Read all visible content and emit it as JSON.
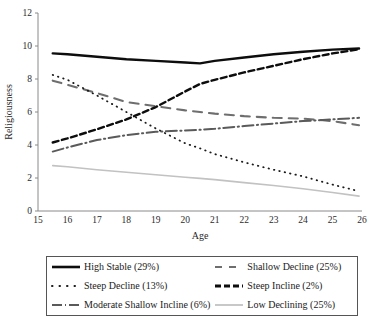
{
  "chart_data": {
    "type": "line",
    "title": "",
    "xlabel": "Age",
    "ylabel": "Religiousness",
    "xlim": [
      15,
      26
    ],
    "ylim": [
      0,
      12
    ],
    "xticks": [
      15,
      16,
      17,
      18,
      19,
      20,
      21,
      22,
      23,
      24,
      25,
      26
    ],
    "yticks": [
      0,
      2,
      4,
      6,
      8,
      10,
      12
    ],
    "grid": false,
    "legend_position": "bottom",
    "x": [
      15.5,
      16,
      17,
      18,
      19,
      20,
      20.5,
      21,
      22,
      23,
      24,
      25,
      25.9
    ],
    "series": [
      {
        "name": "High Stable (29%)",
        "label": "High Stable (29%)",
        "style": "solid-thick",
        "color": "#0d0d0d",
        "width": 2.4,
        "values": [
          9.55,
          9.5,
          9.35,
          9.2,
          9.1,
          9.0,
          8.95,
          9.1,
          9.3,
          9.5,
          9.65,
          9.78,
          9.85
        ]
      },
      {
        "name": "Shallow Decline (25%)",
        "label": "Shallow Decline (25%)",
        "style": "long-dash",
        "color": "#6e6e6e",
        "width": 2.1,
        "values": [
          7.9,
          7.65,
          7.15,
          6.6,
          6.35,
          6.1,
          6.0,
          5.9,
          5.75,
          5.65,
          5.6,
          5.45,
          5.2
        ]
      },
      {
        "name": "Steep Decline (13%)",
        "label": "Steep Decline (13%)",
        "style": "dotted",
        "color": "#1a1a1a",
        "width": 1.8,
        "values": [
          8.25,
          7.95,
          7.0,
          6.0,
          5.0,
          4.1,
          3.8,
          3.45,
          2.95,
          2.5,
          2.1,
          1.6,
          1.2
        ]
      },
      {
        "name": "Steep Incline (2%)",
        "label": "Steep Incline (2%)",
        "style": "heavy-dash",
        "color": "#0d0d0d",
        "width": 2.4,
        "values": [
          4.15,
          4.4,
          4.95,
          5.55,
          6.3,
          7.25,
          7.7,
          7.95,
          8.4,
          8.8,
          9.2,
          9.55,
          9.8
        ]
      },
      {
        "name": "Moderate Shallow Incline (6%)",
        "label": "Moderate Shallow Incline (6%)",
        "style": "dash-dot",
        "color": "#5a5a5a",
        "width": 2.0,
        "values": [
          3.6,
          3.85,
          4.3,
          4.6,
          4.8,
          4.88,
          4.92,
          4.98,
          5.15,
          5.3,
          5.45,
          5.55,
          5.65
        ]
      },
      {
        "name": "Low Declining (25%)",
        "label": "Low Declining (25%)",
        "style": "thin-solid",
        "color": "#c2c2c2",
        "width": 1.6,
        "values": [
          2.75,
          2.68,
          2.5,
          2.35,
          2.2,
          2.05,
          1.98,
          1.9,
          1.72,
          1.55,
          1.35,
          1.12,
          0.9
        ]
      }
    ]
  },
  "axes": {
    "y_title": "Religiousness",
    "x_title": "Age",
    "y_tick_labels": [
      "0",
      "2",
      "4",
      "6",
      "8",
      "10",
      "12"
    ],
    "x_tick_labels": [
      "15",
      "16",
      "17",
      "18",
      "19",
      "20",
      "21",
      "22",
      "23",
      "24",
      "25",
      "26"
    ]
  },
  "legend": {
    "items": [
      {
        "label": "High Stable (29%)",
        "swatch": "solid-thick-swatch"
      },
      {
        "label": "Shallow Decline (25%)",
        "swatch": "long-dash-swatch"
      },
      {
        "label": "Steep Decline (13%)",
        "swatch": "dotted-swatch"
      },
      {
        "label": "Steep Incline (2%)",
        "swatch": "heavy-dash-swatch"
      },
      {
        "label": "Moderate Shallow Incline (6%)",
        "swatch": "dash-dot-swatch"
      },
      {
        "label": "Low Declining (25%)",
        "swatch": "thin-solid-swatch"
      }
    ]
  }
}
